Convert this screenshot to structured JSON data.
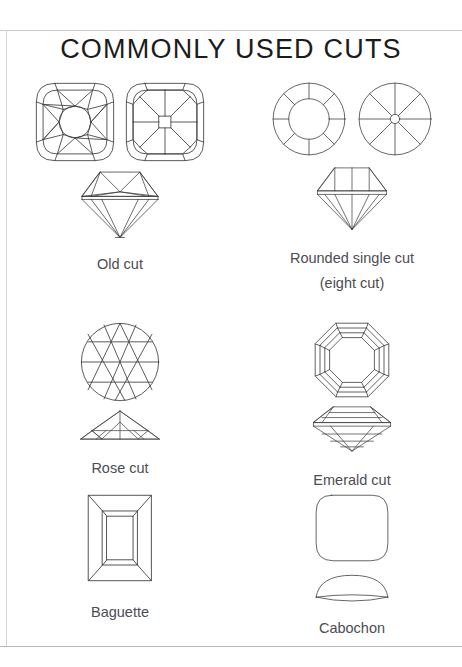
{
  "document": {
    "title": "COMMONLY USED CUTS",
    "title_color": "#1b1b1b",
    "caption_color": "#4d4d52",
    "line_color": "#3b3b40",
    "background": "#ffffff"
  },
  "cuts": [
    {
      "id": "old-cut",
      "label": "Old cut",
      "label_line2": "",
      "row": 1,
      "column": "left",
      "views": [
        "cushion-face-up-a",
        "cushion-face-up-b",
        "old-cut-profile"
      ]
    },
    {
      "id": "rounded-single-cut",
      "label": "Rounded single cut",
      "label_line2": "(eight cut)",
      "row": 1,
      "column": "right",
      "views": [
        "round-crown-face-up",
        "round-pavilion-face-up",
        "single-cut-profile"
      ]
    },
    {
      "id": "rose-cut",
      "label": "Rose cut",
      "label_line2": "",
      "row": 2,
      "column": "left",
      "views": [
        "rose-face-up",
        "rose-profile"
      ]
    },
    {
      "id": "emerald-cut",
      "label": "Emerald cut",
      "label_line2": "",
      "row": 2,
      "column": "right",
      "views": [
        "octagon-face-up",
        "emerald-profile"
      ]
    },
    {
      "id": "baguette",
      "label": "Baguette",
      "label_line2": "",
      "row": 3,
      "column": "left",
      "views": [
        "baguette-face-up"
      ]
    },
    {
      "id": "cabochon",
      "label": "Cabochon",
      "label_line2": "",
      "row": 3,
      "column": "right",
      "views": [
        "cabochon-face-up",
        "cabochon-profile"
      ]
    }
  ]
}
